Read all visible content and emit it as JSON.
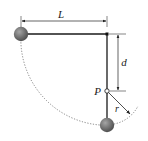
{
  "diagram": {
    "type": "pendulum-with-peg",
    "labels": {
      "length": "L",
      "peg_distance": "d",
      "peg": "P",
      "radius": "r"
    },
    "colors": {
      "ball": "#6b6b6b",
      "ball_highlight": "#9a9a9a",
      "rod": "#1a1a1a",
      "dimension": "#222222",
      "path": "#555555",
      "background": "#ffffff"
    },
    "elements": {
      "pivot": {
        "x": 107,
        "y": 34
      },
      "left_ball": {
        "x": 21,
        "y": 34,
        "r": 7
      },
      "bottom_ball": {
        "x": 107,
        "y": 125,
        "r": 7
      },
      "peg": {
        "x": 107,
        "y": 91,
        "r": 2.2
      }
    }
  }
}
